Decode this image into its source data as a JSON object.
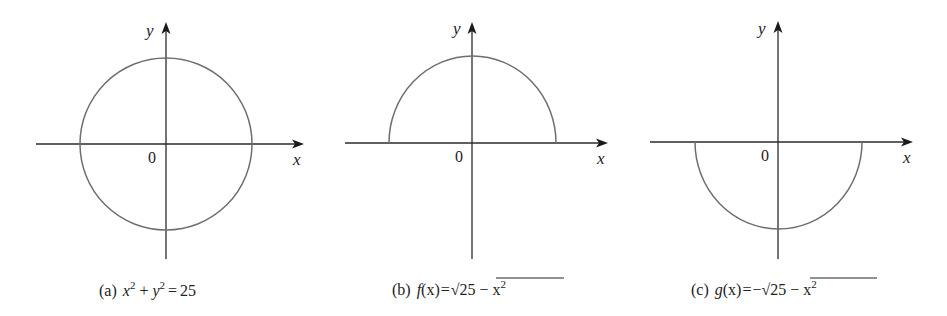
{
  "figure": {
    "panels": [
      {
        "id": "a",
        "caption_tag": "(a)",
        "caption_eq": {
          "lhs": "x",
          "sup1": "2",
          "plus": "+",
          "y": "y",
          "sup2": "2",
          "eq": "=",
          "rhs": "25"
        },
        "caption_text": "(a) x² + y² = 25",
        "axis_labels": {
          "x": "x",
          "y": "y",
          "origin": "0"
        },
        "curve": "full circle"
      },
      {
        "id": "b",
        "caption_tag": "(b)",
        "caption_eq": {
          "fn": "f",
          "arg": "(x)",
          "eq": "=",
          "radicand": "25 − x",
          "sup": "2"
        },
        "caption_text": "(b) f(x) = √(25 − x²)",
        "axis_labels": {
          "x": "x",
          "y": "y",
          "origin": "0"
        },
        "curve": "upper semicircle"
      },
      {
        "id": "c",
        "caption_tag": "(c)",
        "caption_eq": {
          "fn": "g",
          "arg": "(x)",
          "eq": "=",
          "neg": "−",
          "radicand": "25 − x",
          "sup": "2"
        },
        "caption_text": "(c) g(x) = −√(25 − x²)",
        "axis_labels": {
          "x": "x",
          "y": "y",
          "origin": "0"
        },
        "curve": "lower semicircle"
      }
    ],
    "colors": {
      "axis": "#2b2b2b",
      "curve": "#6e6e6e",
      "background": "#ffffff"
    }
  }
}
